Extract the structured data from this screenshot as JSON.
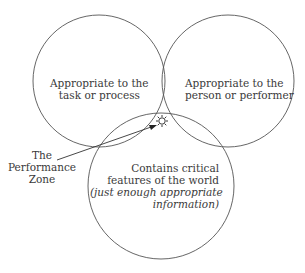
{
  "diagram": {
    "circles": [
      {
        "id": "task",
        "cx": 99,
        "cy": 81,
        "r": 66,
        "label_lines": [
          "Appropriate to the",
          "task or process"
        ]
      },
      {
        "id": "person",
        "cx": 228,
        "cy": 81,
        "r": 66,
        "label_lines": [
          "Appropriate to the",
          "person or performer"
        ]
      },
      {
        "id": "world",
        "cx": 161,
        "cy": 186,
        "r": 73,
        "label_lines": [
          "Contains critical",
          "features of the world"
        ],
        "italic_lines": [
          "(just enough appropriate",
          "information)"
        ]
      }
    ],
    "callout": {
      "label_lines": [
        "The",
        "Performance",
        "Zone"
      ],
      "marker": "sun-star-icon"
    },
    "colors": {
      "stroke": "#555555",
      "text": "#3a3a3a",
      "background": "#ffffff"
    }
  }
}
